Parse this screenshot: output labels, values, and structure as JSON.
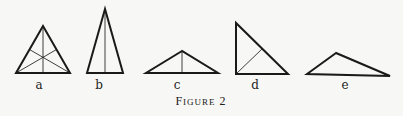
{
  "figure": {
    "caption_first": "F",
    "caption_rest": "igure",
    "caption_number": "2",
    "caption_full": "Figure 2"
  },
  "triangles": [
    {
      "label": "a",
      "description": "equilateral-like triangle with three medians",
      "vertices": [
        [
          43,
          26
        ],
        [
          16,
          73
        ],
        [
          70,
          73
        ]
      ],
      "inner_lines": [
        [
          [
            43,
            26
          ],
          [
            43,
            73
          ]
        ],
        [
          [
            16,
            73
          ],
          [
            56.5,
            49.5
          ]
        ],
        [
          [
            70,
            73
          ],
          [
            29.5,
            49.5
          ]
        ]
      ]
    },
    {
      "label": "b",
      "description": "tall isosceles triangle with altitude",
      "vertices": [
        [
          105,
          9
        ],
        [
          87,
          73
        ],
        [
          123,
          73
        ]
      ],
      "inner_lines": [
        [
          [
            105,
            9
          ],
          [
            105,
            73
          ]
        ]
      ]
    },
    {
      "label": "c",
      "description": "obtuse isosceles triangle with altitude",
      "vertices": [
        [
          182,
          51
        ],
        [
          146,
          73
        ],
        [
          218,
          73
        ]
      ],
      "inner_lines": [
        [
          [
            182,
            51
          ],
          [
            182,
            73
          ]
        ]
      ]
    },
    {
      "label": "d",
      "description": "right triangle with altitude to hypotenuse",
      "vertices": [
        [
          236,
          23
        ],
        [
          236,
          74
        ],
        [
          288,
          74
        ]
      ],
      "inner_lines": [
        [
          [
            236,
            74
          ],
          [
            262,
            49
          ]
        ]
      ]
    },
    {
      "label": "e",
      "description": "scalene obtuse triangle",
      "vertices": [
        [
          336,
          53
        ],
        [
          307,
          74
        ],
        [
          390,
          76
        ]
      ],
      "inner_lines": []
    }
  ],
  "labels": [
    {
      "text": "a",
      "x": 39,
      "y": 80
    },
    {
      "text": "b",
      "x": 99,
      "y": 80
    },
    {
      "text": "c",
      "x": 177,
      "y": 80
    },
    {
      "text": "d",
      "x": 255,
      "y": 80
    },
    {
      "text": "e",
      "x": 345,
      "y": 80
    }
  ],
  "colors": {
    "background": "#f7f7f5",
    "ink": "#1a1a1a"
  }
}
